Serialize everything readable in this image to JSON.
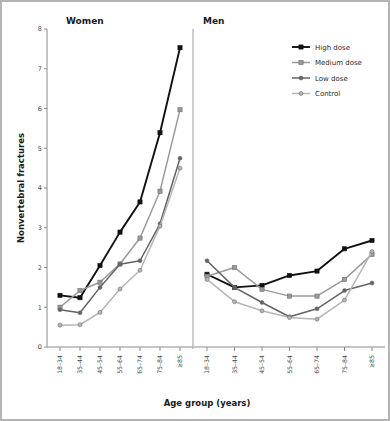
{
  "figure": {
    "panels": [
      {
        "key": "women",
        "title": "Women"
      },
      {
        "key": "men",
        "title": "Men"
      }
    ],
    "legend": {
      "position": "top-right",
      "entries": [
        {
          "label": "High dose",
          "color": "#111111",
          "marker": "square"
        },
        {
          "label": "Medium dose",
          "color": "#9a9a9a",
          "marker": "square"
        },
        {
          "label": "Low dose",
          "color": "#636363",
          "marker": "circle"
        },
        {
          "label": "Control",
          "color": "#b5b5b5",
          "marker": "circle"
        }
      ]
    },
    "colors": {
      "high_dose": "#111111",
      "medium_dose": "#9a9a9a",
      "low_dose": "#636363",
      "control": "#b5b5b5",
      "axis": "#8a8a8a",
      "frame": "#b4b4b4",
      "text": "#1a1a1a"
    }
  },
  "chart_data": {
    "type": "line",
    "title": "",
    "xlabel": "Age group (years)",
    "ylabel": "Nonvertebral fractures",
    "categories": [
      "18–34",
      "35–44",
      "45–54",
      "55–64",
      "65–74",
      "75–84",
      "≥85"
    ],
    "ylim": [
      0,
      8
    ],
    "yticks": [
      0,
      1,
      2,
      3,
      4,
      5,
      6,
      7,
      8
    ],
    "grid": false,
    "legend_position": "top-right",
    "panels": [
      {
        "name": "Women",
        "series": [
          {
            "name": "High dose",
            "values": [
              1.3,
              1.24,
              2.05,
              2.89,
              3.65,
              5.39,
              7.53
            ]
          },
          {
            "name": "Medium dose",
            "values": [
              1.0,
              1.42,
              1.63,
              2.09,
              2.74,
              3.92,
              5.97
            ]
          },
          {
            "name": "Low dose",
            "values": [
              0.94,
              0.86,
              1.5,
              2.08,
              2.17,
              3.1,
              4.75
            ]
          },
          {
            "name": "Control",
            "values": [
              0.55,
              0.56,
              0.87,
              1.46,
              1.93,
              3.04,
              4.5
            ]
          }
        ]
      },
      {
        "name": "Men",
        "series": [
          {
            "name": "High dose",
            "values": [
              1.83,
              1.5,
              1.55,
              1.8,
              1.91,
              2.47,
              2.68
            ]
          },
          {
            "name": "Medium dose",
            "values": [
              1.78,
              2.0,
              1.45,
              1.28,
              1.28,
              1.7,
              2.33
            ]
          },
          {
            "name": "Low dose",
            "values": [
              2.17,
              1.5,
              1.12,
              0.76,
              0.96,
              1.42,
              1.61
            ]
          },
          {
            "name": "Control",
            "values": [
              1.7,
              1.14,
              0.91,
              0.74,
              0.7,
              1.18,
              2.4
            ]
          }
        ]
      }
    ]
  }
}
